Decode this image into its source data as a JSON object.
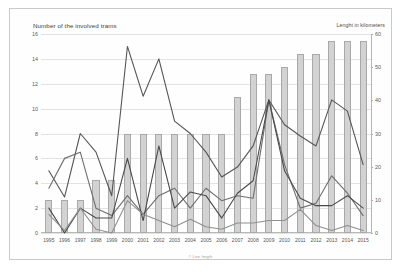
{
  "titles": {
    "left_axis_title": "Number of the involved trams",
    "right_axis_title": "Lenght in kilometers",
    "watermark": "",
    "credit": "© Line length"
  },
  "chart_data": {
    "type": "bar",
    "title": "Number of the involved trams",
    "xlabel": "",
    "ylabel": "Number of the involved trams",
    "y2label": "Lenght in kilometers",
    "grid": true,
    "legend_position": "none",
    "categories": [
      "1995",
      "1996",
      "1997",
      "1998",
      "1999",
      "2000",
      "2001",
      "2002",
      "2003",
      "2004",
      "2005",
      "2006",
      "2007",
      "2008",
      "2009",
      "2010",
      "2011",
      "2012",
      "2013",
      "2014",
      "2015"
    ],
    "ylim": [
      0,
      16
    ],
    "y2lim": [
      0,
      60
    ],
    "yticks": [
      0,
      2,
      4,
      6,
      8,
      10,
      12,
      14,
      16
    ],
    "y2ticks": [
      0,
      10,
      20,
      30,
      40,
      50,
      60
    ],
    "bar_series": {
      "name": "Lenght in kilometers",
      "axis": "right",
      "color": "#d2d2d2",
      "values": [
        10,
        10,
        10,
        16,
        16,
        30,
        30,
        30,
        30,
        30,
        30,
        30,
        41,
        48,
        48,
        50,
        54,
        54,
        58,
        58,
        58
      ]
    },
    "series": [
      {
        "name": "line-1",
        "axis": "left",
        "color": "#555555",
        "values": [
          5.0,
          2.9,
          8.0,
          6.5,
          3.0,
          15.0,
          11.0,
          14.0,
          9.0,
          8.0,
          6.5,
          4.5,
          5.3,
          7.0,
          10.7,
          8.7,
          7.8,
          7.0,
          10.7,
          9.8,
          5.5
        ]
      },
      {
        "name": "line-2",
        "axis": "left",
        "color": "#6e6e6e",
        "values": [
          3.6,
          6.0,
          6.5,
          2.0,
          1.4,
          3.0,
          1.5,
          3.0,
          3.6,
          2.0,
          3.6,
          2.6,
          3.0,
          2.8,
          10.7,
          5.5,
          2.0,
          2.4,
          4.6,
          3.2,
          1.4
        ]
      },
      {
        "name": "line-3",
        "axis": "left",
        "color": "#4a4a4a",
        "values": [
          2.0,
          0.0,
          2.0,
          1.2,
          1.2,
          6.0,
          1.0,
          7.0,
          2.0,
          3.3,
          3.0,
          1.2,
          3.2,
          4.2,
          10.7,
          5.0,
          2.8,
          2.2,
          2.2,
          3.0,
          2.0
        ]
      },
      {
        "name": "line-4",
        "axis": "left",
        "color": "#8f8f8f",
        "values": [
          1.5,
          0.2,
          2.0,
          0.3,
          0.0,
          2.6,
          1.5,
          1.0,
          0.5,
          1.1,
          0.5,
          0.3,
          0.8,
          0.8,
          1.0,
          1.0,
          1.9,
          0.6,
          0.2,
          0.6,
          0.2
        ]
      }
    ]
  }
}
